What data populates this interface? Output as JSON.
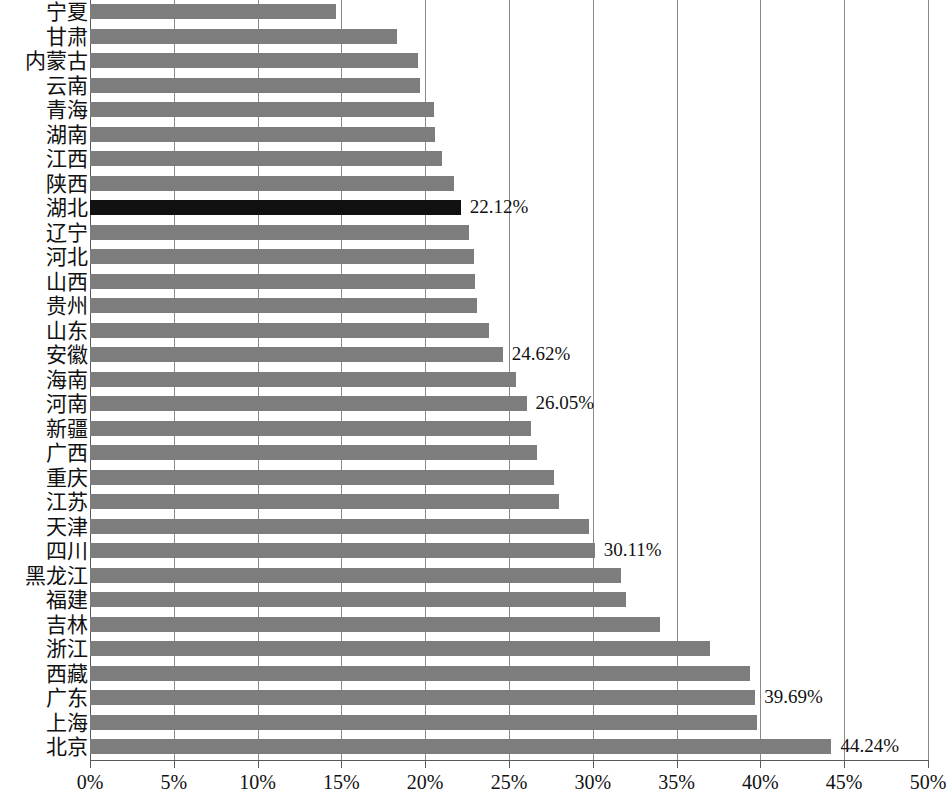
{
  "chart_data": {
    "type": "bar",
    "orientation": "horizontal",
    "title": "",
    "subtitle": "",
    "xlabel": "",
    "ylabel": "",
    "xlim": [
      0,
      50
    ],
    "xtick_labels": [
      "0%",
      "5%",
      "10%",
      "15%",
      "20%",
      "25%",
      "30%",
      "35%",
      "40%",
      "45%",
      "50%"
    ],
    "xticks": [
      0,
      5,
      10,
      15,
      20,
      25,
      30,
      35,
      40,
      45,
      50
    ],
    "grid": "vertical",
    "legend": "none",
    "value_unit": "%",
    "bar_color": "#7d7d7d",
    "highlight_color": "#111111",
    "highlight_category": "湖北",
    "categories": [
      "宁夏",
      "甘肃",
      "内蒙古",
      "云南",
      "青海",
      "湖南",
      "江西",
      "陕西",
      "湖北",
      "辽宁",
      "河北",
      "山西",
      "贵州",
      "山东",
      "安徽",
      "海南",
      "河南",
      "新疆",
      "广西",
      "重庆",
      "江苏",
      "天津",
      "四川",
      "黑龙江",
      "福建",
      "吉林",
      "浙江",
      "西藏",
      "广东",
      "上海",
      "北京"
    ],
    "values": [
      14.7,
      18.3,
      19.6,
      19.7,
      20.5,
      20.6,
      21.0,
      21.7,
      22.12,
      22.6,
      22.9,
      23.0,
      23.1,
      23.8,
      24.62,
      25.4,
      26.05,
      26.3,
      26.7,
      27.7,
      28.0,
      29.8,
      30.11,
      31.7,
      32.0,
      34.0,
      37.0,
      39.4,
      39.69,
      39.8,
      44.24
    ],
    "labeled_points": [
      {
        "category": "湖北",
        "value": 22.12,
        "label": "22.12%"
      },
      {
        "category": "安徽",
        "value": 24.62,
        "label": "24.62%"
      },
      {
        "category": "河南",
        "value": 26.05,
        "label": "26.05%"
      },
      {
        "category": "四川",
        "value": 30.11,
        "label": "30.11%"
      },
      {
        "category": "广东",
        "value": 39.69,
        "label": "39.69%"
      },
      {
        "category": "北京",
        "value": 44.24,
        "label": "44.24%"
      }
    ]
  }
}
